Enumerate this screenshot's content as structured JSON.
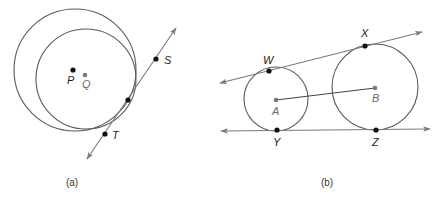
{
  "colors": {
    "circle": "#5a5a5a",
    "line": "#7a7a7a",
    "point_dark": "#111111",
    "point_gray": "#7a7a7a",
    "label_dark": "#222222",
    "label_gray": "#6a6a6a"
  },
  "panels": [
    {
      "id": "a",
      "caption": "(a)",
      "caption_pos": [
        72,
        186
      ],
      "circles": [
        {
          "name": "outer-circle-P",
          "cx": 75,
          "cy": 70,
          "r": 61
        },
        {
          "name": "inner-circle-Q",
          "cx": 86,
          "cy": 79,
          "r": 50
        }
      ],
      "lines": [
        {
          "name": "tangent-line-ST",
          "x1": 87,
          "y1": 159,
          "x2": 176,
          "y2": 28,
          "arrow_start": true,
          "arrow_end": true
        }
      ],
      "points": [
        {
          "label": "P",
          "x": 73,
          "y": 70,
          "lx": 67,
          "ly": 84,
          "style": "dark"
        },
        {
          "label": "Q",
          "x": 85,
          "y": 75,
          "lx": 82,
          "ly": 88,
          "style": "gray"
        },
        {
          "label": "S",
          "x": 156,
          "y": 59,
          "lx": 164,
          "ly": 64,
          "style": "dark"
        },
        {
          "label": "T",
          "x": 105,
          "y": 134,
          "lx": 112,
          "ly": 139,
          "style": "dark"
        },
        {
          "label": "",
          "x": 128,
          "y": 100,
          "lx": 0,
          "ly": 0,
          "style": "dark"
        }
      ]
    },
    {
      "id": "b",
      "caption": "(b)",
      "caption_pos": [
        327,
        186
      ],
      "circles": [
        {
          "name": "circle-A",
          "cx": 276,
          "cy": 99,
          "r": 32
        },
        {
          "name": "circle-B",
          "cx": 375,
          "cy": 87,
          "r": 43
        }
      ],
      "lines": [
        {
          "name": "tangent-line-WX",
          "x1": 220,
          "y1": 83,
          "x2": 422,
          "y2": 32,
          "arrow_start": true,
          "arrow_end": true
        },
        {
          "name": "tangent-line-YZ",
          "x1": 221,
          "y1": 131,
          "x2": 430,
          "y2": 129,
          "arrow_start": true,
          "arrow_end": true
        },
        {
          "name": "segment-AB",
          "x1": 276,
          "y1": 100,
          "x2": 375,
          "y2": 88,
          "arrow_start": false,
          "arrow_end": false
        }
      ],
      "points": [
        {
          "label": "W",
          "x": 269,
          "y": 71,
          "lx": 263,
          "ly": 64,
          "style": "dark"
        },
        {
          "label": "X",
          "x": 365,
          "y": 46,
          "lx": 361,
          "ly": 37,
          "style": "dark"
        },
        {
          "label": "Y",
          "x": 277,
          "y": 130,
          "lx": 273,
          "ly": 146,
          "style": "dark"
        },
        {
          "label": "Z",
          "x": 376,
          "y": 130,
          "lx": 372,
          "ly": 146,
          "style": "dark"
        },
        {
          "label": "A",
          "x": 276,
          "y": 100,
          "lx": 272,
          "ly": 115,
          "style": "gray"
        },
        {
          "label": "B",
          "x": 375,
          "y": 88,
          "lx": 372,
          "ly": 102,
          "style": "gray"
        }
      ]
    }
  ]
}
